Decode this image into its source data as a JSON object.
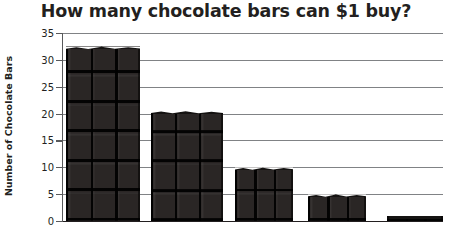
{
  "chart": {
    "title": "How many chocolate bars can $1 buy?",
    "ylabel": "Number of Chocolate Bars",
    "xlabel": ""
  },
  "axis": {
    "yticks": [
      "0",
      "5",
      "10",
      "15",
      "20",
      "25",
      "30",
      "35"
    ]
  },
  "chart_data": {
    "type": "bar",
    "title": "How many chocolate bars can $1 buy?",
    "xlabel": "",
    "ylabel": "Number of Chocolate Bars",
    "categories": [
      "1",
      "2",
      "3",
      "4",
      "5"
    ],
    "values": [
      32.5,
      20.5,
      10,
      5,
      1
    ],
    "ylim": [
      0,
      35
    ],
    "ytick_values": [
      0,
      5,
      10,
      15,
      20,
      25,
      30,
      35
    ],
    "grid": "horizontal",
    "legend": "none",
    "bar_color": "#2a2625",
    "bar_style": "chocolate-bar-texture"
  }
}
